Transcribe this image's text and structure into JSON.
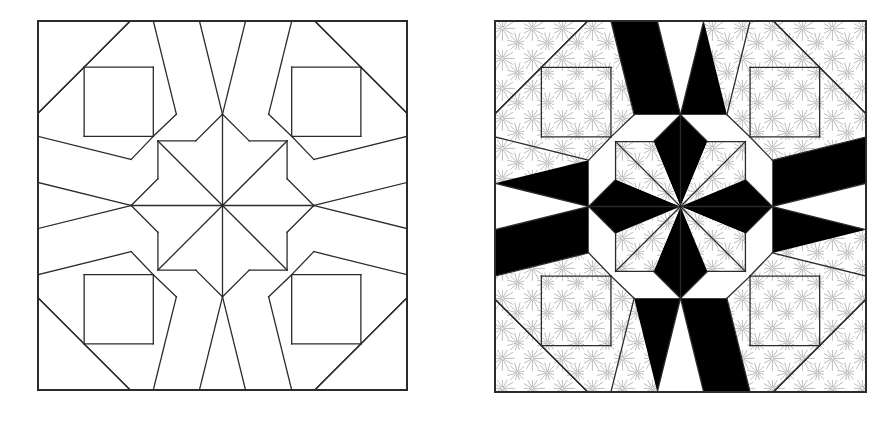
{
  "figure": {
    "background_color": "#ffffff",
    "width": 892,
    "height": 437,
    "panel_count": 2
  },
  "panels": [
    {
      "id": "left-panel",
      "name": "line-drawing-block",
      "label": "Pieced quilt block line drawing",
      "x": 37,
      "y": 20,
      "size": 369,
      "fill_mode": "outline",
      "stroke_color": "#2b2b2b",
      "fill_color": "#ffffff",
      "border_stroke_width": 2.0,
      "inner_stroke_width": 1.3
    },
    {
      "id": "right-panel",
      "name": "shaded-block",
      "label": "Same block shaded with solid black and printed fabrics",
      "x": 494,
      "y": 20,
      "size": 371,
      "fill_mode": "shaded",
      "stroke_color": "#2b2b2b",
      "solid_color": "#000000",
      "print_color": "#ffffff",
      "print_motif_color": "#b4b4b4",
      "border_stroke_width": 2.0,
      "inner_stroke_width": 1.3
    }
  ],
  "block_geometry": {
    "name": "eight-pointed-star-with-corner-squares",
    "grid_divisions": 4,
    "unit_coordinates": [
      0,
      0.25,
      0.5,
      0.75,
      1
    ],
    "center_star_points": 8,
    "notes": "Four quadrants, each a 90-degree rotation of the same unit"
  },
  "print_motif": {
    "name": "starburst",
    "ray_count": 12,
    "spacing": 30,
    "radius": 12,
    "color": "#b4b4b4",
    "stroke_width": 0.9
  },
  "shading_plan": {
    "solid_black_pieces": 12,
    "printed_pieces": 20,
    "plain_white_pieces": 16,
    "center_star_alternation": [
      "black",
      "print",
      "black",
      "print",
      "black",
      "print",
      "black",
      "print"
    ]
  },
  "colors": {
    "ink": "#2b2b2b",
    "black": "#000000",
    "white": "#ffffff",
    "print_gray": "#b4b4b4",
    "page_background": "#ffffff"
  }
}
